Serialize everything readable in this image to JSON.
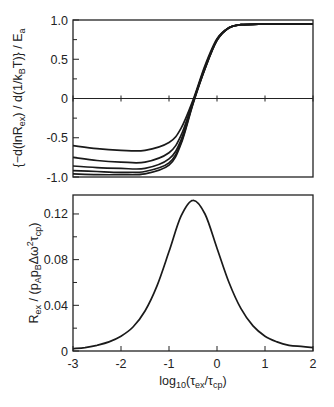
{
  "chart_data": [
    {
      "type": "line",
      "panel": "top",
      "title": "",
      "xlabel": "",
      "ylabel": "{-d(lnR_ex) / d(1/k_B T)} / E_a",
      "ylabel_parts": {
        "pre": "{−d(lnR",
        "sub1": "ex",
        "mid": ") / d(1/k",
        "sub2": "B",
        "post": "T)} / E",
        "sub3": "a"
      },
      "xlim": [
        -3,
        2
      ],
      "ylim": [
        -1.0,
        1.0
      ],
      "y_ticks": [
        "1.0",
        "0.5",
        "0",
        "-0.5",
        "-1.0"
      ],
      "y_tick_values": [
        1.0,
        0.5,
        0,
        -0.5,
        -1.0
      ],
      "x_ticks": [
        -3,
        -2,
        -1,
        0,
        1,
        2
      ],
      "zero_line": true,
      "grid": false,
      "x": [
        -3.0,
        -2.5,
        -2.0,
        -1.5,
        -1.0,
        -0.75,
        -0.5,
        -0.25,
        0.0,
        0.25,
        0.5,
        1.0,
        1.5,
        2.0
      ],
      "series": [
        {
          "name": "curve-1",
          "values": [
            -0.6,
            -0.64,
            -0.66,
            -0.66,
            -0.56,
            -0.38,
            -0.02,
            0.42,
            0.76,
            0.9,
            0.94,
            0.95,
            0.95,
            0.95
          ]
        },
        {
          "name": "curve-2",
          "values": [
            -0.75,
            -0.79,
            -0.81,
            -0.81,
            -0.69,
            -0.47,
            -0.04,
            0.4,
            0.75,
            0.9,
            0.94,
            0.95,
            0.95,
            0.95
          ]
        },
        {
          "name": "curve-3",
          "values": [
            -0.86,
            -0.88,
            -0.89,
            -0.89,
            -0.77,
            -0.53,
            -0.05,
            0.39,
            0.75,
            0.9,
            0.94,
            0.95,
            0.95,
            0.95
          ]
        },
        {
          "name": "curve-4",
          "values": [
            -0.92,
            -0.93,
            -0.94,
            -0.93,
            -0.82,
            -0.56,
            -0.06,
            0.38,
            0.74,
            0.9,
            0.94,
            0.95,
            0.95,
            0.95
          ]
        },
        {
          "name": "curve-5",
          "values": [
            -0.96,
            -0.97,
            -0.97,
            -0.96,
            -0.85,
            -0.58,
            -0.07,
            0.38,
            0.74,
            0.9,
            0.94,
            0.95,
            0.95,
            0.95
          ]
        }
      ]
    },
    {
      "type": "line",
      "panel": "bottom",
      "title": "",
      "xlabel": "log10(τex/τcp)",
      "xlabel_parts": {
        "pre": "log",
        "sub1": "10",
        "mid": "(τ",
        "sub2": "ex",
        "mid2": "/τ",
        "sub3": "cp",
        "post": ")"
      },
      "ylabel": "R_ex / (p_A p_B Δω² τ_cp)",
      "ylabel_parts": {
        "pre": "R",
        "sub1": "ex",
        "mid": " / (p",
        "sub2": "A",
        "mid2": "p",
        "sub3": "B",
        "mid3": "Δω",
        "sup": "2",
        "mid4": "τ",
        "sub4": "cp",
        "post": ")"
      },
      "xlim": [
        -3,
        2
      ],
      "ylim": [
        0,
        0.135
      ],
      "x_ticks": [
        "-3",
        "-2",
        "-1",
        "0",
        "1",
        "2"
      ],
      "x_tick_values": [
        -3,
        -2,
        -1,
        0,
        1,
        2
      ],
      "y_ticks": [
        "0.12",
        "0.08",
        "0.04",
        "0"
      ],
      "y_tick_values": [
        0.12,
        0.08,
        0.04,
        0
      ],
      "grid": false,
      "x": [
        -3.0,
        -2.75,
        -2.5,
        -2.25,
        -2.0,
        -1.75,
        -1.5,
        -1.25,
        -1.0,
        -0.75,
        -0.5,
        -0.25,
        0.0,
        0.25,
        0.5,
        0.75,
        1.0,
        1.25,
        1.5,
        1.75,
        2.0
      ],
      "series": [
        {
          "name": "R_ex",
          "values": [
            0.002,
            0.003,
            0.005,
            0.008,
            0.013,
            0.021,
            0.035,
            0.057,
            0.087,
            0.118,
            0.132,
            0.12,
            0.09,
            0.06,
            0.037,
            0.022,
            0.013,
            0.008,
            0.005,
            0.004,
            0.003
          ]
        }
      ]
    }
  ]
}
